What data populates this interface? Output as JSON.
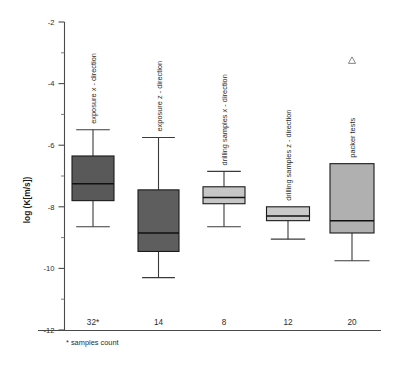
{
  "chart_data": {
    "type": "box",
    "title": "",
    "xlabel": "",
    "ylabel": "log (K[m/s])",
    "ylim": [
      -12,
      -2
    ],
    "ytick_labels": [
      "-2",
      "-4",
      "-6",
      "-8",
      "-10",
      "-12"
    ],
    "ytick_values": [
      -2,
      -4,
      -6,
      -8,
      -10,
      -12
    ],
    "yminor_values": [
      -3,
      -5,
      -7,
      -9,
      -11
    ],
    "grid": false,
    "legend": "none",
    "footnote": "* samples count",
    "categories": [
      "exposure x - direction",
      "exposure z - direction",
      "drilling samples x - direction",
      "drilling samples z - direction",
      "packer tests"
    ],
    "xtick_labels": [
      "32*",
      "14",
      "8",
      "12",
      "20"
    ],
    "sample_counts": [
      32,
      14,
      8,
      12,
      20
    ],
    "boxes": [
      {
        "label": "exposure x - direction",
        "xtick": "32*",
        "n": 32,
        "min": -8.65,
        "q1": -7.8,
        "median": -7.25,
        "q3": -6.35,
        "max": -5.5,
        "fill": "#595959",
        "outliers": []
      },
      {
        "label": "exposure z - direction",
        "xtick": "14",
        "n": 14,
        "min": -10.3,
        "q1": -9.45,
        "median": -8.85,
        "q3": -7.45,
        "max": -5.75,
        "fill": "#5e5e5e",
        "outliers": []
      },
      {
        "label": "drilling samples x - direction",
        "xtick": "8",
        "n": 8,
        "min": -8.65,
        "q1": -7.9,
        "median": -7.7,
        "q3": -7.35,
        "max": -6.85,
        "fill": "#c6c6c6",
        "outliers": []
      },
      {
        "label": "drilling samples z - direction",
        "xtick": "12",
        "n": 12,
        "min": -9.05,
        "q1": -8.45,
        "median": -8.3,
        "q3": -8.0,
        "max": -8.0,
        "fill": "#c9c9c9",
        "outliers": []
      },
      {
        "label": "packer tests",
        "xtick": "20",
        "n": 20,
        "min": -9.75,
        "q1": -8.85,
        "median": -8.45,
        "q3": -6.6,
        "max": -6.6,
        "fill": "#b0b0b0",
        "outliers": [
          -3.25
        ]
      }
    ],
    "colors": {
      "axis": "#4a4a4a",
      "box_stroke": "#1a1a1a",
      "median": "#111111",
      "whisker": "#3a3a3a",
      "outlier_stroke": "#777777",
      "text": "#2b2b2b",
      "background": "#ffffff"
    }
  }
}
